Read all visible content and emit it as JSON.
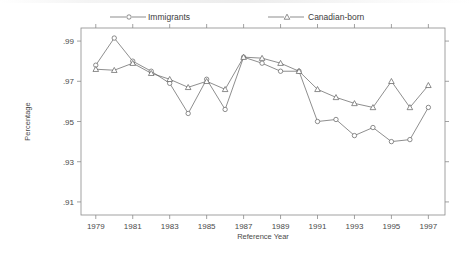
{
  "chart_data": {
    "type": "line",
    "title": "",
    "xlabel": "Reference Year",
    "ylabel": "Percentage",
    "x": [
      1979,
      1980,
      1981,
      1982,
      1983,
      1984,
      1985,
      1986,
      1987,
      1988,
      1989,
      1990,
      1991,
      1992,
      1993,
      1994,
      1995,
      1996,
      1997
    ],
    "xlim": [
      1978.2,
      1997.9
    ],
    "ylim": [
      0.9035,
      0.9965
    ],
    "xticks": [
      1979,
      1981,
      1983,
      1985,
      1987,
      1989,
      1991,
      1993,
      1995,
      1997
    ],
    "xticklabels": [
      "1979",
      "1981",
      "1983",
      "1985",
      "1987",
      "1989",
      "1991",
      "1993",
      "1995",
      "1997"
    ],
    "yticks": [
      0.91,
      0.93,
      0.95,
      0.97,
      0.99
    ],
    "yticklabels": [
      ".91",
      ".93",
      ".95",
      ".97",
      ".99"
    ],
    "grid": false,
    "legend_position": "top",
    "series": [
      {
        "name": "Immigrants",
        "marker": "circle",
        "values": [
          0.978,
          0.9915,
          0.98,
          0.975,
          0.969,
          0.954,
          0.971,
          0.956,
          0.982,
          0.979,
          0.975,
          0.975,
          0.95,
          0.951,
          0.943,
          0.947,
          0.94,
          0.941,
          0.957
        ]
      },
      {
        "name": "Canadian-born",
        "marker": "triangle",
        "values": [
          0.976,
          0.9755,
          0.979,
          0.974,
          0.971,
          0.967,
          0.97,
          0.966,
          0.982,
          0.9815,
          0.979,
          0.975,
          0.966,
          0.962,
          0.959,
          0.957,
          0.97,
          0.957,
          0.968
        ]
      }
    ]
  },
  "legend": {
    "items": [
      {
        "label": "Immigrants",
        "marker": "circle"
      },
      {
        "label": "Canadian-born",
        "marker": "triangle"
      }
    ]
  },
  "colors": {
    "axis": "#8a8a8a",
    "line": "#5d5d5d",
    "marker_fill": "#ffffff",
    "text": "#3c3c3c",
    "background": "#ffffff"
  }
}
